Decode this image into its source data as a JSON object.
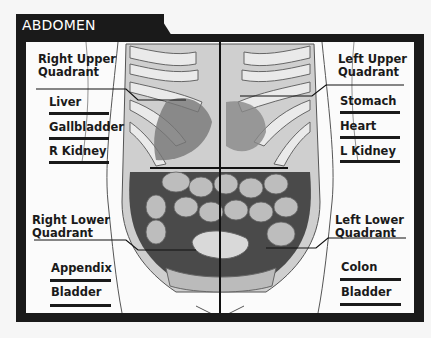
{
  "title": "ABDOMEN",
  "quadrants": {
    "right_upper": {
      "line1": "Right Upper",
      "line2": "Quadrant",
      "items": [
        "Liver",
        "Gallbladder",
        "R Kidney"
      ]
    },
    "left_upper": {
      "line1": "Left Upper",
      "line2": "Quadrant",
      "items": [
        "Stomach",
        "Heart",
        "L Kidney"
      ]
    },
    "right_lower": {
      "line1": "Right Lower",
      "line2": "Quadrant",
      "items": [
        "Appendix",
        "Bladder"
      ]
    },
    "left_lower": {
      "line1": "Left Lower",
      "line2": "Quadrant",
      "items": [
        "Colon",
        "Bladder"
      ]
    }
  },
  "colors": {
    "frame": "#1a1a1a",
    "background": "#fbfbfb",
    "text": "#1a1a1a"
  }
}
